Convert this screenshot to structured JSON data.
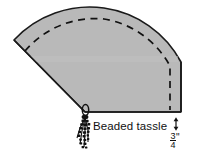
{
  "figure": {
    "type": "sewing-pattern-illustration",
    "colors": {
      "fill": "#b9b9b9",
      "stroke": "#1a1a1a",
      "dashed_seam": "#111111",
      "background": "#ffffff",
      "text": "#111111"
    },
    "shape": {
      "name": "quarter-circle-fan",
      "description": "Wedge / quarter circle fan panel with curved outer edge, straight left radius edge and straight horizontal bottom edge meeting at a pivot point",
      "pivot_point": "bottom-left apex",
      "seam_line_style": "dashed"
    }
  },
  "labels": {
    "tassel": "Beaded tassle",
    "dimension_numerator": "3",
    "dimension_denominator": "4",
    "dimension_unit": "\""
  },
  "annotations": {
    "tassel_marker": {
      "name": "beaded-tassel",
      "description": "Small loop ring at fan pivot with hanging beaded strands"
    },
    "dimension_marker": {
      "name": "seam-allowance-dimension",
      "value": "3/4\"",
      "description": "Double headed vertical arrow indicating 3/4 inch seam allowance at lower right edge"
    }
  }
}
